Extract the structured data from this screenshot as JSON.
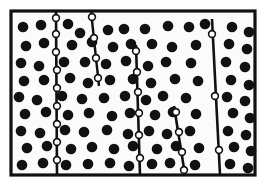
{
  "figure": {
    "name": "grain-microstructure-schematic",
    "type": "schematic-diagram",
    "canvas": {
      "width": 265,
      "height": 191
    },
    "background_color": "#ffffff",
    "ink_color": "#111111"
  },
  "frame": {
    "name": "specimen-outline",
    "x": 11,
    "y": 11,
    "width": 244,
    "height": 164,
    "stroke_width": 3.2,
    "stroke_color": "#111111",
    "fill_color": "#fbfbfb"
  },
  "grain_boundaries": [
    {
      "id": "gb-1",
      "label": "boundary-left",
      "x1": 56,
      "y1": 11,
      "x2": 57,
      "y2": 175,
      "stroke_width": 2.6
    },
    {
      "id": "gb-2",
      "label": "boundary-second",
      "x1": 91,
      "y1": 11,
      "x2": 99,
      "y2": 86,
      "stroke_width": 2.4
    },
    {
      "id": "gb-3",
      "label": "boundary-third",
      "x1": 136,
      "y1": 45,
      "x2": 140,
      "y2": 175,
      "stroke_width": 2.6
    },
    {
      "id": "gb-4",
      "label": "boundary-fourth",
      "x1": 174,
      "y1": 106,
      "x2": 185,
      "y2": 175,
      "stroke_width": 2.6
    },
    {
      "id": "gb-5",
      "label": "boundary-right",
      "x1": 212,
      "y1": 19,
      "x2": 220,
      "y2": 175,
      "stroke_width": 2.6
    }
  ],
  "matrix_precipitates": {
    "label": "matrix-precipitate",
    "fill_color": "#111111",
    "radius": 5.3,
    "count": 96,
    "points": [
      [
        23,
        27
      ],
      [
        41,
        25
      ],
      [
        68,
        24
      ],
      [
        80,
        33
      ],
      [
        108,
        30
      ],
      [
        124,
        29
      ],
      [
        145,
        29
      ],
      [
        168,
        26
      ],
      [
        189,
        27
      ],
      [
        205,
        24
      ],
      [
        232,
        27
      ],
      [
        249,
        32
      ],
      [
        26,
        46
      ],
      [
        44,
        43
      ],
      [
        72,
        45
      ],
      [
        92,
        42
      ],
      [
        113,
        47
      ],
      [
        131,
        44
      ],
      [
        152,
        44
      ],
      [
        172,
        47
      ],
      [
        196,
        45
      ],
      [
        229,
        44
      ],
      [
        247,
        49
      ],
      [
        21,
        63
      ],
      [
        39,
        66
      ],
      [
        64,
        62
      ],
      [
        85,
        62
      ],
      [
        106,
        64
      ],
      [
        126,
        61
      ],
      [
        148,
        66
      ],
      [
        166,
        62
      ],
      [
        191,
        63
      ],
      [
        226,
        62
      ],
      [
        245,
        67
      ],
      [
        24,
        81
      ],
      [
        44,
        80
      ],
      [
        70,
        78
      ],
      [
        88,
        83
      ],
      [
        110,
        80
      ],
      [
        133,
        79
      ],
      [
        151,
        83
      ],
      [
        175,
        79
      ],
      [
        198,
        81
      ],
      [
        231,
        80
      ],
      [
        249,
        85
      ],
      [
        19,
        97
      ],
      [
        37,
        100
      ],
      [
        62,
        96
      ],
      [
        82,
        99
      ],
      [
        104,
        98
      ],
      [
        125,
        96
      ],
      [
        146,
        100
      ],
      [
        163,
        96
      ],
      [
        186,
        98
      ],
      [
        227,
        97
      ],
      [
        245,
        101
      ],
      [
        25,
        114
      ],
      [
        46,
        112
      ],
      [
        68,
        115
      ],
      [
        89,
        113
      ],
      [
        112,
        116
      ],
      [
        130,
        113
      ],
      [
        155,
        115
      ],
      [
        173,
        112
      ],
      [
        196,
        114
      ],
      [
        233,
        113
      ],
      [
        250,
        118
      ],
      [
        21,
        131
      ],
      [
        40,
        133
      ],
      [
        65,
        130
      ],
      [
        84,
        132
      ],
      [
        107,
        130
      ],
      [
        128,
        134
      ],
      [
        149,
        131
      ],
      [
        167,
        134
      ],
      [
        190,
        131
      ],
      [
        228,
        131
      ],
      [
        246,
        135
      ],
      [
        27,
        148
      ],
      [
        47,
        146
      ],
      [
        71,
        149
      ],
      [
        92,
        147
      ],
      [
        114,
        149
      ],
      [
        133,
        146
      ],
      [
        157,
        149
      ],
      [
        176,
        146
      ],
      [
        199,
        148
      ],
      [
        234,
        147
      ],
      [
        251,
        151
      ],
      [
        22,
        165
      ],
      [
        43,
        163
      ],
      [
        66,
        165
      ],
      [
        88,
        164
      ],
      [
        110,
        163
      ],
      [
        129,
        166
      ],
      [
        152,
        164
      ],
      [
        170,
        163
      ],
      [
        195,
        165
      ],
      [
        230,
        164
      ],
      [
        248,
        168
      ]
    ]
  },
  "boundary_precipitates": {
    "label": "grain-boundary-precipitate",
    "fill_color": "#ffffff",
    "stroke_color": "#111111",
    "radius": 3.4,
    "stroke_width": 1.6,
    "count": 26,
    "points": [
      [
        56,
        18
      ],
      [
        56,
        34
      ],
      [
        56,
        52
      ],
      [
        57,
        70
      ],
      [
        57,
        88
      ],
      [
        57,
        106
      ],
      [
        57,
        124
      ],
      [
        57,
        142
      ],
      [
        57,
        160
      ],
      [
        92,
        17
      ],
      [
        94,
        38
      ],
      [
        96,
        58
      ],
      [
        98,
        78
      ],
      [
        136,
        51
      ],
      [
        137,
        72
      ],
      [
        138,
        92
      ],
      [
        139,
        113
      ],
      [
        139,
        135
      ],
      [
        140,
        158
      ],
      [
        176,
        112
      ],
      [
        179,
        132
      ],
      [
        182,
        152
      ],
      [
        184,
        170
      ],
      [
        212,
        34
      ],
      [
        215,
        96
      ],
      [
        219,
        150
      ]
    ]
  },
  "legend": {
    "visible": false,
    "items": [
      {
        "symbol": "filled-circle",
        "meaning": "matrix precipitate"
      },
      {
        "symbol": "open-circle",
        "meaning": "grain boundary precipitate"
      },
      {
        "symbol": "line",
        "meaning": "grain boundary"
      }
    ]
  }
}
